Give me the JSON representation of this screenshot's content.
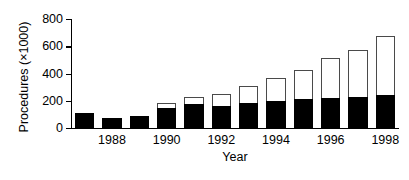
{
  "chart_data": {
    "type": "bar",
    "subtype": "stacked-bar",
    "title": "",
    "xlabel": "Year",
    "ylabel": "Procedures (×1000)",
    "ylim": [
      0,
      800
    ],
    "yticks": [
      0,
      200,
      400,
      600,
      800
    ],
    "ytick_labels": [
      "0",
      "200",
      "400",
      "600",
      "800"
    ],
    "grid": false,
    "legend": false,
    "legend_position": "none",
    "categories": [
      "1987",
      "1988",
      "1989",
      "1990",
      "1991",
      "1992",
      "1993",
      "1994",
      "1995",
      "1996",
      "1997",
      "1998"
    ],
    "xtick_labels_shown": [
      "1988",
      "1990",
      "1992",
      "1994",
      "1996",
      "1998"
    ],
    "series": [
      {
        "name": "lower-segment",
        "fill": "#000000",
        "values": [
          110,
          70,
          85,
          150,
          175,
          165,
          180,
          200,
          210,
          218,
          225,
          245
        ]
      },
      {
        "name": "upper-segment",
        "fill": "#ffffff",
        "values": [
          0,
          0,
          0,
          30,
          50,
          83,
          130,
          165,
          213,
          294,
          350,
          430
        ]
      }
    ],
    "totals": [
      110,
      70,
      85,
      180,
      225,
      248,
      310,
      365,
      423,
      512,
      575,
      675
    ]
  },
  "colors": {
    "axis": "#000000",
    "lower_fill": "#000000",
    "upper_fill": "#ffffff",
    "upper_stroke": "#4a4a4a",
    "background": "#ffffff"
  }
}
